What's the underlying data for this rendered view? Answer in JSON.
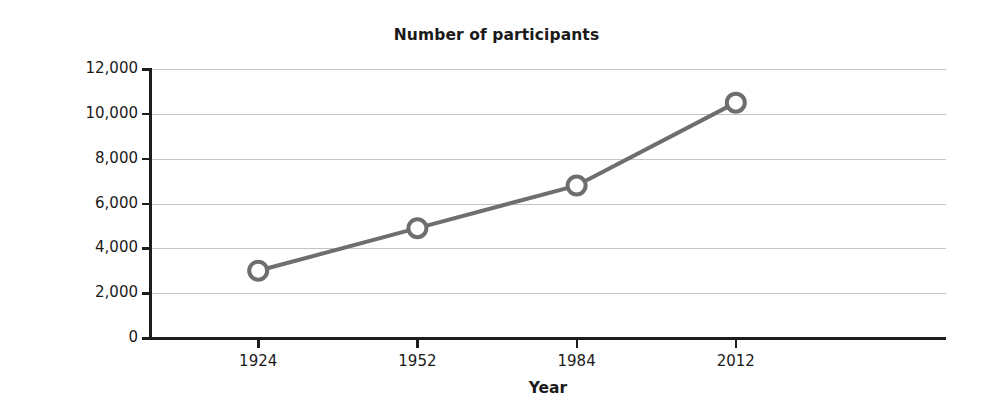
{
  "chart_data": {
    "type": "line",
    "title": "Number of participants",
    "xlabel": "Year",
    "ylabel": "Participants",
    "categories": [
      "1924",
      "1952",
      "1984",
      "2012"
    ],
    "x": [
      1924,
      1952,
      1984,
      2012
    ],
    "values": [
      3000,
      4900,
      6800,
      10500
    ],
    "series": [
      {
        "name": "Participants",
        "values": [
          3000,
          4900,
          6800,
          10500
        ]
      }
    ],
    "ylim": [
      0,
      12000
    ],
    "ytick_values": [
      12000,
      10000,
      8000,
      6000,
      4000,
      2000,
      0
    ],
    "ytick_labels": [
      "12,000",
      "10,000",
      "8,000",
      "6,000",
      "4,000",
      "2,000",
      "0"
    ],
    "xtick_labels": [
      "1924",
      "1952",
      "1984",
      "2012"
    ],
    "grid": true,
    "legend": false,
    "legend_position": "none",
    "colors": {
      "line": "#6e6e6e",
      "marker_fill": "#ffffff",
      "marker_stroke": "#6e6e6e",
      "gridline": "#c4c4c4",
      "axis": "#1d1d1d",
      "text": "#1a1a1a",
      "background": "#ffffff"
    }
  }
}
